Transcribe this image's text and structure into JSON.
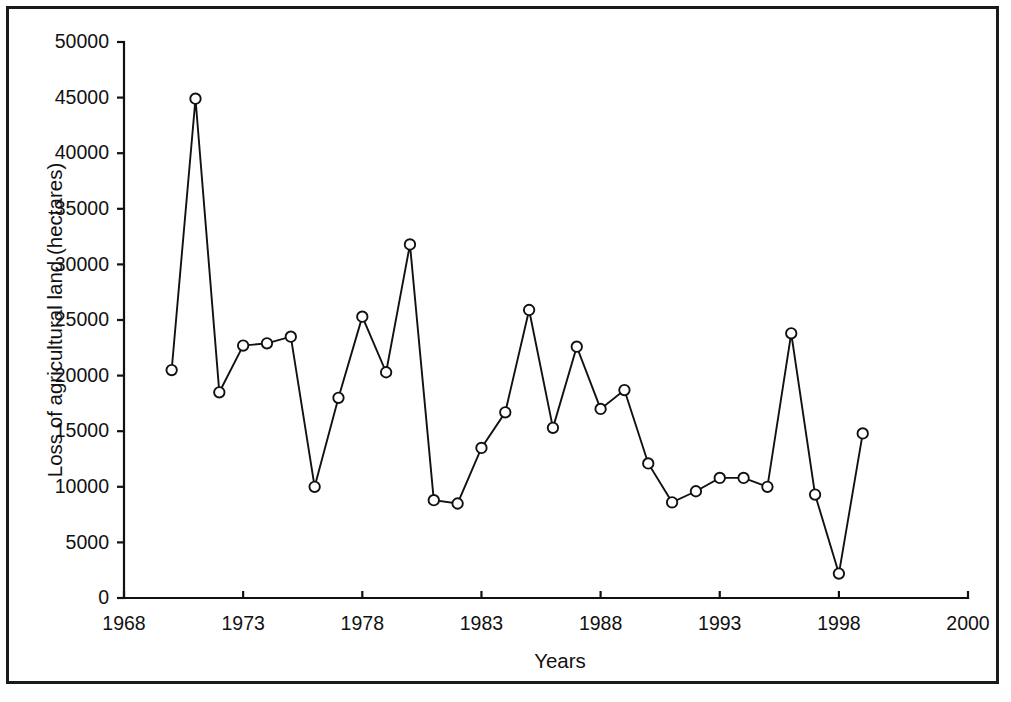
{
  "chart_data": {
    "type": "line",
    "title": "",
    "subtitle": "",
    "xlabel": "Years",
    "ylabel": "Loss of agricultural land (hectares)",
    "xlim": [
      1968,
      2000
    ],
    "ylim": [
      0,
      50000
    ],
    "grid": false,
    "legend": null,
    "x_tick_labels": [
      "1968",
      "1973",
      "1978",
      "1983",
      "1988",
      "1993",
      "1998",
      "2000"
    ],
    "x_ticks": [
      1968,
      1973,
      1978,
      1983,
      1988,
      1993,
      1998,
      2000
    ],
    "y_tick_labels": [
      "0",
      "5000",
      "10000",
      "15000",
      "20000",
      "25000",
      "30000",
      "35000",
      "40000",
      "45000",
      "50000"
    ],
    "y_ticks": [
      0,
      5000,
      10000,
      15000,
      20000,
      25000,
      30000,
      35000,
      40000,
      45000,
      50000
    ],
    "marker": "open-circle",
    "x": [
      1970,
      1971,
      1972,
      1973,
      1974,
      1975,
      1976,
      1977,
      1978,
      1979,
      1980,
      1981,
      1982,
      1983,
      1984,
      1985,
      1986,
      1987,
      1988,
      1989,
      1990,
      1991,
      1992,
      1993,
      1994,
      1995,
      1996,
      1997,
      1998,
      1999
    ],
    "values": [
      20500,
      44900,
      18500,
      22700,
      22900,
      23500,
      10000,
      18000,
      25300,
      20300,
      31800,
      8800,
      8500,
      13500,
      16700,
      25900,
      15300,
      22600,
      17000,
      18700,
      12100,
      8600,
      9600,
      10800,
      10800,
      10000,
      23800,
      9300,
      2200,
      14800
    ],
    "categories": [
      "1970",
      "1971",
      "1972",
      "1973",
      "1974",
      "1975",
      "1976",
      "1977",
      "1978",
      "1979",
      "1980",
      "1981",
      "1982",
      "1983",
      "1984",
      "1985",
      "1986",
      "1987",
      "1988",
      "1989",
      "1990",
      "1991",
      "1992",
      "1993",
      "1994",
      "1995",
      "1996",
      "1997",
      "1998",
      "1999"
    ],
    "series": [
      {
        "name": "Loss of agricultural land",
        "values": [
          20500,
          44900,
          18500,
          22700,
          22900,
          23500,
          10000,
          18000,
          25300,
          20300,
          31800,
          8800,
          8500,
          13500,
          16700,
          25900,
          15300,
          22600,
          17000,
          18700,
          12100,
          8600,
          9600,
          10800,
          10800,
          10000,
          23800,
          9300,
          2200,
          14800
        ]
      }
    ],
    "colors": {
      "line": "#111111",
      "marker_fill": "#ffffff",
      "marker_stroke": "#111111",
      "axis": "#111111",
      "background": "#ffffff",
      "frame": "#1a1a1a"
    }
  }
}
